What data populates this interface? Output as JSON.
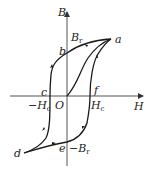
{
  "diagram": {
    "type": "hysteresis-loop",
    "axes": {
      "x_label": "H",
      "y_label": "B",
      "origin_label": "O"
    },
    "points": [
      {
        "id": "a",
        "label": "a"
      },
      {
        "id": "b",
        "label": "b"
      },
      {
        "id": "c",
        "label": "c"
      },
      {
        "id": "d",
        "label": "d"
      },
      {
        "id": "e",
        "label": "e"
      },
      {
        "id": "f",
        "label": "f"
      }
    ],
    "annotations": {
      "br_pos": "B",
      "br_pos_sub": "r",
      "br_neg": "−B",
      "br_neg_sub": "r",
      "hc_pos": "H",
      "hc_pos_sub": "c",
      "hc_neg": "−H",
      "hc_neg_sub": "c"
    },
    "colors": {
      "stroke": "#1a1a1a",
      "axis": "#555555"
    }
  }
}
